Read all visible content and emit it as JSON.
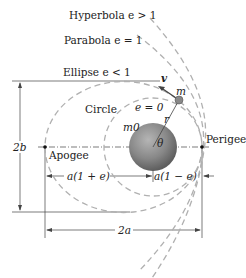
{
  "diagram": {
    "labels": {
      "hyperbola": "Hyperbola e > 1",
      "parabola": "Parabola e = 1",
      "ellipse": "Ellipse e < 1",
      "circle": "Circle",
      "circle_e": "e = 0",
      "velocity": "v",
      "satellite_mass": "m",
      "radius": "r",
      "central_mass": "m0",
      "angle": "θ",
      "perigee": "Perigee",
      "apogee": "Apogee",
      "minor_axis": "2b",
      "major_axis": "2a",
      "apogee_distance": "a(1 + e)",
      "perigee_distance": "a(1 − e)"
    },
    "colors": {
      "curve": "#b0b0b0",
      "earth": "#7a7a7a",
      "line": "#333333"
    }
  }
}
